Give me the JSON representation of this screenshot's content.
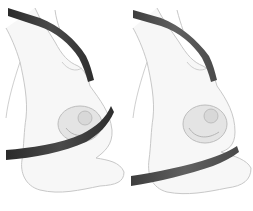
{
  "figure": {
    "panels": [
      {
        "id": "left",
        "description": "Pregnant woman with seatbelt lap strap across the belly",
        "belt_color": "#3a3a3a"
      },
      {
        "id": "right",
        "description": "Pregnant woman with seatbelt lap strap below the belly",
        "belt_color": "#555555"
      }
    ],
    "colors": {
      "background": "#ffffff",
      "body_fill": "#f7f7f7",
      "body_stroke": "#c8c8c8",
      "fetus_fill": "#e4e4e4"
    }
  }
}
